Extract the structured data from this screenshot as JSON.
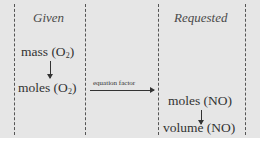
{
  "diagram": {
    "columns": {
      "given": {
        "header": "Given"
      },
      "requested": {
        "header": "Requested"
      }
    },
    "nodes": {
      "mass_o2": {
        "label": "mass (O",
        "sub": "2",
        "suffix": ")"
      },
      "moles_o2": {
        "label": "moles (O",
        "sub": "2",
        "suffix": ")"
      },
      "moles_no": {
        "label": "moles (NO)"
      },
      "volume_no": {
        "label": "volume (NO)"
      }
    },
    "edges": {
      "equation_factor": {
        "label": "equation factor"
      }
    },
    "colors": {
      "background": "#e6e6e6",
      "text": "#333333",
      "lines": "#555555"
    }
  }
}
